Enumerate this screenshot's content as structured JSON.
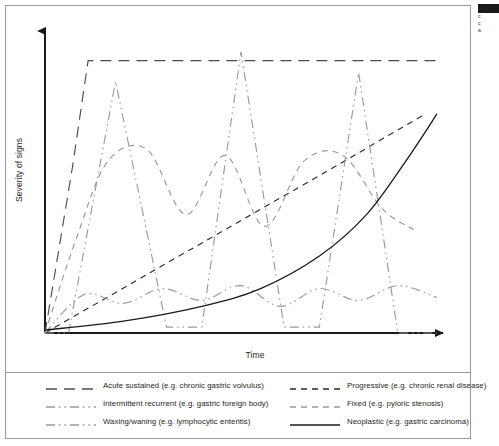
{
  "figure": {
    "axes": {
      "y_label": "Severity of signs",
      "x_label": "Time"
    },
    "side_caption": {
      "line1": "c",
      "line2": "c",
      "line3": "a"
    }
  },
  "legend": {
    "entries": [
      {
        "label": "Acute sustained (e.g. chronic gastric volvulus)",
        "style": "long-dash",
        "color": "#4d4d4d",
        "column": "left"
      },
      {
        "label": "Progressive (e.g. chronic renal disease)",
        "style": "short-dash",
        "color": "#2b2b2b",
        "column": "right"
      },
      {
        "label": "Intermittent recurrent (e.g. gastric foreign body)",
        "style": "dash-dot-dot",
        "color": "#9a9a9a",
        "column": "left"
      },
      {
        "label": "Fixed (e.g. pyloric stenosis)",
        "style": "short-dash",
        "color": "#9a9a9a",
        "column": "right"
      },
      {
        "label": "Waxing/waning (e.g. lymphocytic enteritis)",
        "style": "dash-dot-dot",
        "color": "#9a9a9a",
        "column": "left"
      },
      {
        "label": "Neoplastic (e.g. gastric carcinoma)",
        "style": "solid",
        "color": "#1a1a1a",
        "column": "right"
      }
    ]
  },
  "chart_data": {
    "type": "line",
    "title": "",
    "subtitle": "",
    "xlabel": "Time",
    "ylabel": "Severity of signs",
    "xlim": [
      0,
      100
    ],
    "ylim": [
      0,
      100
    ],
    "grid": false,
    "axis_style": "arrowed L-frame (no tick marks, no tick labels)",
    "legend_position": "below plot, two columns, bordered box",
    "series": [
      {
        "name": "Acute sustained (e.g. chronic gastric volvulus)",
        "style": "long-dash",
        "color": "#4d4d4d",
        "description": "Steep rise from origin to a high plateau held flat across the remaining time axis",
        "x": [
          0,
          3,
          7,
          11,
          100
        ],
        "y": [
          0,
          24,
          56,
          92,
          92
        ]
      },
      {
        "name": "Progressive (e.g. chronic renal disease)",
        "style": "short-dash",
        "color": "#2b2b2b",
        "description": "Straight steadily increasing line from origin to upper right",
        "x": [
          0,
          25,
          50,
          75,
          97
        ],
        "y": [
          0,
          19,
          38,
          57,
          74
        ]
      },
      {
        "name": "Intermittent recurrent (e.g. gastric foreign body)",
        "style": "dash-dot-dot",
        "color": "#9a9a9a",
        "description": "Three tall narrow triangular spikes returning to baseline between episodes",
        "x": [
          0,
          6,
          18,
          31,
          40,
          50,
          61,
          70,
          80,
          90,
          100
        ],
        "y": [
          0,
          0,
          85,
          2,
          2,
          95,
          2,
          2,
          88,
          0,
          0
        ]
      },
      {
        "name": "Fixed (e.g. pyloric stenosis)",
        "style": "short-dash",
        "color": "#9a9a9a",
        "description": "Rises to a moderate-high level then oscillates as broad rounded humps of constant amplitude",
        "x": [
          0,
          8,
          16,
          26,
          36,
          46,
          56,
          66,
          76,
          86,
          94
        ],
        "y": [
          0,
          32,
          58,
          62,
          40,
          60,
          36,
          58,
          60,
          42,
          35
        ]
      },
      {
        "name": "Waxing/waning (e.g. lymphocytic enteritis)",
        "style": "dash-dot-dot",
        "color": "#9a9a9a",
        "description": "Low-amplitude gentle undulation around a low baseline severity",
        "x": [
          0,
          10,
          20,
          30,
          40,
          50,
          60,
          70,
          80,
          90,
          100
        ],
        "y": [
          0,
          13,
          10,
          15,
          11,
          16,
          9,
          15,
          11,
          16,
          12
        ]
      },
      {
        "name": "Neoplastic (e.g. gastric carcinoma)",
        "style": "solid",
        "color": "#1a1a1a",
        "description": "Slow flat start then accelerating exponential rise to the top right",
        "x": [
          0,
          20,
          40,
          55,
          70,
          82,
          92,
          100
        ],
        "y": [
          1,
          4,
          9,
          15,
          26,
          40,
          58,
          74
        ]
      }
    ]
  }
}
